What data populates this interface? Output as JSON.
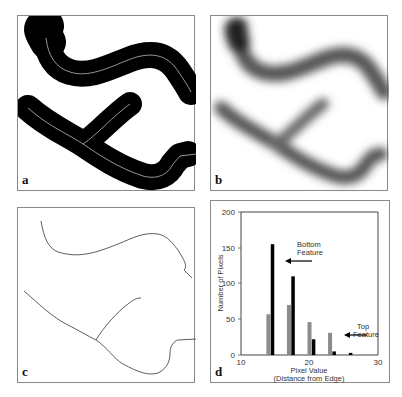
{
  "panels": {
    "a": {
      "label": "a",
      "description": "Binary thresholded features (black) with skeleton lines"
    },
    "b": {
      "label": "b",
      "description": "Distance map of features (blurred grayscale)"
    },
    "c": {
      "label": "c",
      "description": "Skeletons of features"
    },
    "d": {
      "label": "d",
      "description": "Histogram of pixel values along skeletons"
    }
  },
  "chart_data": {
    "type": "bar",
    "title": "",
    "xlabel": "Pixel Value",
    "xlabel_sub": "(Distance from Edge)",
    "ylabel": "Number of Pixels",
    "xlim": [
      10,
      30
    ],
    "ylim": [
      0,
      200
    ],
    "xticks": [
      "10",
      "20",
      "30"
    ],
    "yticks": [
      "0",
      "50",
      "100",
      "150",
      "200"
    ],
    "grid": false,
    "series": [
      {
        "name": "Top Feature",
        "color": "#8c8c8c",
        "x": [
          14,
          17,
          20,
          23
        ],
        "values": [
          57,
          70,
          46,
          31
        ]
      },
      {
        "name": "Bottom Feature",
        "color": "#000000",
        "x": [
          14.6,
          17.6,
          20.6,
          23.6,
          26
        ],
        "values": [
          155,
          110,
          22,
          5,
          3
        ]
      }
    ],
    "annotations": [
      {
        "text_line1": "Bottom",
        "text_line2": "Feature",
        "arrow_to_series": "Bottom Feature"
      },
      {
        "text_line1": "Top",
        "text_line2": "Feature",
        "arrow_to_series": "Top Feature"
      }
    ]
  }
}
